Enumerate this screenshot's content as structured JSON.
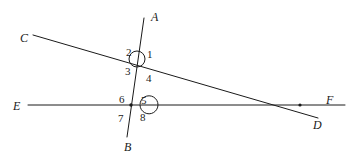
{
  "figure": {
    "width": 357,
    "height": 151,
    "background_color": "#ffffff",
    "stroke_color": "#1a1a1a",
    "label_color": "#1a1a1a"
  },
  "points": [
    {
      "id": "A",
      "label": "A",
      "x": 151,
      "y": 11
    },
    {
      "id": "B",
      "label": "B",
      "x": 124,
      "y": 141
    },
    {
      "id": "C",
      "label": "C",
      "x": 20,
      "y": 32
    },
    {
      "id": "D",
      "label": "D",
      "x": 313,
      "y": 119
    },
    {
      "id": "E",
      "label": "E",
      "x": 13,
      "y": 100
    },
    {
      "id": "F",
      "label": "F",
      "x": 326,
      "y": 94
    }
  ],
  "lines": [
    {
      "id": "AB",
      "name": "line-ab",
      "from": "A",
      "to": "B",
      "x1": 144,
      "y1": 18,
      "x2": 127,
      "y2": 137
    },
    {
      "id": "CD",
      "name": "line-cd",
      "from": "C",
      "to": "D",
      "x1": 33,
      "y1": 35,
      "x2": 318,
      "y2": 118
    },
    {
      "id": "EF",
      "name": "line-ef",
      "from": "E",
      "to": "F",
      "x1": 28,
      "y1": 105,
      "x2": 345,
      "y2": 105
    }
  ],
  "intersections": [
    {
      "id": "P1",
      "name": "intersection-ab-cd",
      "x": 137,
      "y": 59,
      "marker": "circle",
      "radius": 8
    },
    {
      "id": "P2",
      "name": "intersection-ab-ef",
      "x": 131,
      "y": 105,
      "marker": "arc-dot",
      "radius": 9
    },
    {
      "id": "P3",
      "name": "intersection-cd-ef",
      "x": 300,
      "y": 105,
      "marker": "dot",
      "radius": 1.6
    }
  ],
  "angles": [
    {
      "id": "a1",
      "label": "1",
      "at": "P1",
      "x": 147,
      "y": 49
    },
    {
      "id": "a2",
      "label": "2",
      "at": "P1",
      "x": 126,
      "y": 47
    },
    {
      "id": "a3",
      "label": "3",
      "at": "P1",
      "x": 125,
      "y": 66
    },
    {
      "id": "a4",
      "label": "4",
      "at": "P1",
      "x": 146,
      "y": 73
    },
    {
      "id": "a5",
      "label": "5",
      "at": "P2",
      "x": 141,
      "y": 95
    },
    {
      "id": "a6",
      "label": "6",
      "at": "P2",
      "x": 119,
      "y": 94
    },
    {
      "id": "a7",
      "label": "7",
      "at": "P2",
      "x": 118,
      "y": 113
    },
    {
      "id": "a8",
      "label": "8",
      "at": "P2",
      "x": 140,
      "y": 112
    }
  ]
}
